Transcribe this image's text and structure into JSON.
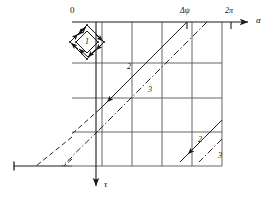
{
  "figure": {
    "kind": "phase-plane-characteristics-diagram",
    "axes": {
      "horizontal": {
        "label": "α",
        "name": "alpha-axis",
        "direction": "right"
      },
      "vertical": {
        "label": "τ",
        "name": "tau-axis",
        "direction": "down"
      },
      "origin_label": "0"
    },
    "ticks": [
      {
        "label": "Δψ",
        "name": "delta-psi-tick"
      },
      {
        "label": "2π",
        "name": "two-pi-tick"
      }
    ],
    "curve_labels": [
      {
        "text": "1",
        "name": "rhombus-label-1"
      },
      {
        "text": "2",
        "name": "solid-line-label-2-upper"
      },
      {
        "text": "3",
        "name": "dashdot-line-label-3-upper"
      },
      {
        "text": "2",
        "name": "solid-line-label-2-lower"
      },
      {
        "text": "3",
        "name": "dashdot-line-label-3-lower"
      }
    ],
    "colors": {
      "ink": "#1a1a1a",
      "grid": "#555555",
      "background": "#ffffff"
    },
    "grid": {
      "columns": 5,
      "rows": 4
    },
    "line_families": [
      {
        "id": "2",
        "style": "solid",
        "note": "characteristic family 2"
      },
      {
        "id": "3",
        "style": "dash-dot",
        "note": "characteristic family 3"
      }
    ]
  }
}
